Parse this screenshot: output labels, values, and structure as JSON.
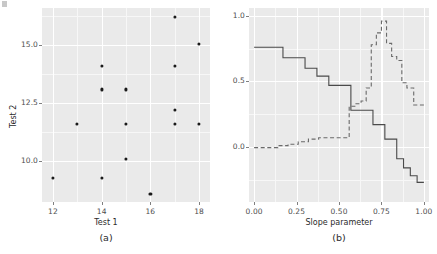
{
  "figure": {
    "width": 437,
    "height": 254,
    "panel_background": "#eaeaea",
    "grid_color": "#ffffff",
    "point_color": "#1a1a1a",
    "solid_color": "#4a4a4a",
    "dashed_color": "#6a6a6a"
  },
  "chart_data": [
    {
      "type": "scatter",
      "id": "panel-a",
      "title": "",
      "caption": "(a)",
      "xlabel": "Test 1",
      "ylabel": "Test 2",
      "xlim": [
        11.55,
        18.45
      ],
      "ylim": [
        8.25,
        16.6
      ],
      "xticks": [
        12,
        14,
        16,
        18
      ],
      "xticklabels": [
        "12",
        "14",
        "16",
        "18"
      ],
      "yticks": [
        10.0,
        12.5,
        15.0
      ],
      "yticklabels": [
        "10.0",
        "12.5",
        "15.0"
      ],
      "grid": true,
      "legend": "none",
      "points": [
        {
          "x": 12,
          "y": 9.3
        },
        {
          "x": 13,
          "y": 11.6
        },
        {
          "x": 14,
          "y": 14.1
        },
        {
          "x": 14,
          "y": 13.1
        },
        {
          "x": 14,
          "y": 9.3
        },
        {
          "x": 15,
          "y": 13.1
        },
        {
          "x": 15,
          "y": 11.6
        },
        {
          "x": 15,
          "y": 10.1
        },
        {
          "x": 16,
          "y": 8.6
        },
        {
          "x": 17,
          "y": 16.2
        },
        {
          "x": 17,
          "y": 14.1
        },
        {
          "x": 17,
          "y": 12.2
        },
        {
          "x": 17,
          "y": 11.6
        },
        {
          "x": 18,
          "y": 15.05
        },
        {
          "x": 18,
          "y": 11.6
        }
      ]
    },
    {
      "type": "line",
      "id": "panel-b",
      "title": "",
      "caption": "(b)",
      "xlabel": "Slope parameter",
      "ylabel": "",
      "xlim": [
        -0.03,
        1.03
      ],
      "ylim": [
        -0.42,
        1.06
      ],
      "xticks": [
        0.0,
        0.25,
        0.5,
        0.75,
        1.0
      ],
      "xticklabels": [
        "0.00",
        "0.25",
        "0.50",
        "0.75",
        "1.00"
      ],
      "yticks": [
        0.0,
        0.5,
        1.0
      ],
      "yticklabels": [
        "0.0",
        "0.5",
        "1.0"
      ],
      "grid": true,
      "legend": "none",
      "drawstyle": "steps-post",
      "series": [
        {
          "name": "solid",
          "style": "solid",
          "x": [
            0.0,
            0.11,
            0.17,
            0.24,
            0.3,
            0.37,
            0.44,
            0.5,
            0.57,
            0.63,
            0.67,
            0.7,
            0.74,
            0.77,
            0.81,
            0.84,
            0.88,
            0.92,
            0.96,
            1.0
          ],
          "y": [
            0.76,
            0.76,
            0.68,
            0.68,
            0.6,
            0.54,
            0.47,
            0.47,
            0.28,
            0.28,
            0.28,
            0.17,
            0.17,
            0.06,
            0.06,
            -0.09,
            -0.16,
            -0.22,
            -0.27,
            -0.27
          ]
        },
        {
          "name": "dashed",
          "style": "dashed",
          "x": [
            0.0,
            0.08,
            0.14,
            0.2,
            0.26,
            0.32,
            0.38,
            0.44,
            0.5,
            0.56,
            0.6,
            0.63,
            0.66,
            0.69,
            0.72,
            0.75,
            0.78,
            0.81,
            0.84,
            0.87,
            0.9,
            0.94,
            1.0
          ],
          "y": [
            -0.005,
            -0.005,
            0.01,
            0.02,
            0.04,
            0.06,
            0.07,
            0.07,
            0.07,
            0.31,
            0.33,
            0.35,
            0.45,
            0.78,
            0.87,
            0.96,
            0.79,
            0.69,
            0.66,
            0.49,
            0.45,
            0.32,
            0.32
          ]
        }
      ]
    }
  ],
  "axis_a": {
    "xlabel": "Test 1",
    "ylabel": "Test 2",
    "caption": "(a)",
    "xticklabels": [
      "12",
      "14",
      "16",
      "18"
    ],
    "yticklabels": [
      "15.0",
      "12.5",
      "10.0"
    ]
  },
  "axis_b": {
    "xlabel": "Slope parameter",
    "caption": "(b)",
    "xticklabels": [
      "0.00",
      "0.25",
      "0.50",
      "0.75",
      "1.00"
    ],
    "yticklabels": [
      "1.0",
      "0.5",
      "0.0"
    ]
  }
}
